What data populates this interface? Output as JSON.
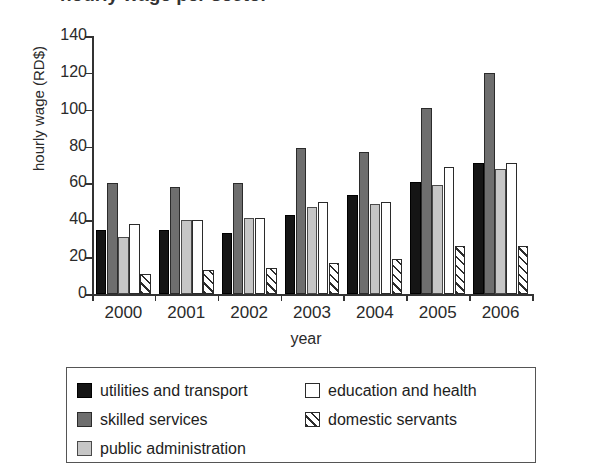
{
  "title_partial": "hourly wage per sector",
  "chart_data": {
    "type": "bar",
    "title": "",
    "xlabel": "year",
    "ylabel": "hourly wage (RD$)",
    "categories": [
      "2000",
      "2001",
      "2002",
      "2003",
      "2004",
      "2005",
      "2006"
    ],
    "ylim": [
      0,
      140
    ],
    "yticks": [
      0,
      20,
      40,
      60,
      80,
      100,
      120,
      140
    ],
    "grid": false,
    "legend_position": "below-plot",
    "series": [
      {
        "name": "utilities and transport",
        "key": "utilities",
        "color": "#151515",
        "pattern": "solid",
        "values": [
          35,
          35,
          33,
          43,
          54,
          61,
          71
        ]
      },
      {
        "name": "skilled services",
        "key": "skilled",
        "color": "#6e6e6e",
        "pattern": "solid",
        "values": [
          60,
          58,
          60,
          79,
          77,
          101,
          120
        ]
      },
      {
        "name": "public administration",
        "key": "public",
        "color": "#c6c6c6",
        "pattern": "solid",
        "values": [
          31,
          40,
          41,
          47,
          49,
          59,
          68
        ]
      },
      {
        "name": "education and health",
        "key": "education",
        "color": "#ffffff",
        "pattern": "open",
        "values": [
          38,
          40,
          41,
          50,
          50,
          69,
          71
        ]
      },
      {
        "name": "domestic servants",
        "key": "domestic",
        "color": "#ffffff",
        "pattern": "diagonal-hatch",
        "values": [
          11,
          13,
          14,
          17,
          19,
          26,
          26
        ]
      }
    ]
  },
  "legend": {
    "left_column": [
      {
        "label": "utilities and transport",
        "series": "utilities"
      },
      {
        "label": "skilled services",
        "series": "skilled"
      },
      {
        "label": "public administration",
        "series": "public"
      }
    ],
    "right_column": [
      {
        "label": "education and health",
        "series": "education"
      },
      {
        "label": "domestic servants",
        "series": "domestic"
      }
    ]
  }
}
